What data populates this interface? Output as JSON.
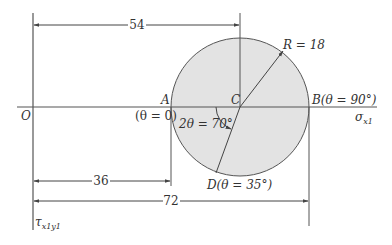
{
  "diagram": {
    "colors": {
      "circle_fill": "#e3e3e3",
      "line": "#555555",
      "text": "#333333"
    },
    "points": {
      "O": {
        "label": "O"
      },
      "A": {
        "label": "A",
        "sub": "(θ = 0)"
      },
      "B": {
        "label": "B(θ = 90°)"
      },
      "C": {
        "label": "C"
      },
      "D": {
        "label": "D(θ = 35°)"
      }
    },
    "radius_label": "R = 18",
    "angle_label": "2θ = 70°",
    "dimensions": {
      "oc": "54",
      "oa": "36",
      "ob": "72"
    },
    "axes": {
      "horizontal": "σ",
      "horizontal_sub": "x1",
      "vertical": "τ",
      "vertical_sub": "x1y1"
    }
  }
}
